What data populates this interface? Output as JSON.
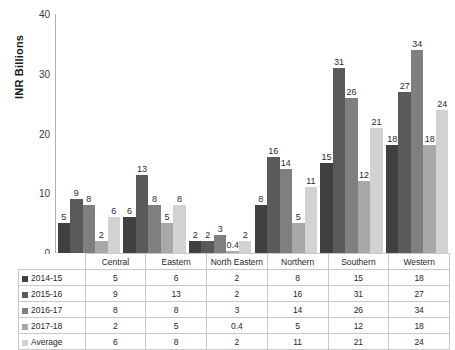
{
  "chart_data": {
    "type": "bar",
    "title": "",
    "subtitle": "",
    "xlabel": "",
    "ylabel": "INR Billions",
    "ylim": [
      0,
      40
    ],
    "yticks": [
      0,
      10,
      20,
      30,
      40
    ],
    "grid": false,
    "legend_position": "data-table",
    "data_labels": true,
    "categories": [
      "Central",
      "Eastern",
      "North Eastern",
      "Northern",
      "Southern",
      "Western"
    ],
    "series": [
      {
        "name": "2014-15",
        "color": "#404040",
        "values": [
          5,
          6,
          2,
          8,
          15,
          18
        ]
      },
      {
        "name": "2015-16",
        "color": "#5a5a5a",
        "values": [
          9,
          13,
          2,
          16,
          31,
          27
        ]
      },
      {
        "name": "2016-17",
        "color": "#7f7f7f",
        "values": [
          8,
          8,
          3,
          14,
          26,
          34
        ]
      },
      {
        "name": "2017-18",
        "color": "#a8a8a8",
        "values": [
          2,
          5,
          0.4,
          5,
          12,
          18
        ]
      },
      {
        "name": "Average",
        "color": "#d2d2d2",
        "values": [
          6,
          8,
          2,
          11,
          21,
          24
        ]
      }
    ],
    "value_labels": [
      [
        "5",
        "6",
        "2",
        "8",
        "15",
        "18"
      ],
      [
        "9",
        "13",
        "2",
        "16",
        "31",
        "27"
      ],
      [
        "8",
        "8",
        "3",
        "14",
        "26",
        "34"
      ],
      [
        "2",
        "5",
        "0.4",
        "5",
        "12",
        "18"
      ],
      [
        "6",
        "8",
        "2",
        "11",
        "21",
        "24"
      ]
    ]
  },
  "table": {
    "corner_label": "",
    "column_headers": [
      "Central",
      "Eastern",
      "North Eastern",
      "Northern",
      "Southern",
      "Western"
    ],
    "rows": [
      {
        "label": "2014-15",
        "color": "#404040",
        "values": [
          "5",
          "6",
          "2",
          "8",
          "15",
          "18"
        ]
      },
      {
        "label": "2015-16",
        "color": "#5a5a5a",
        "values": [
          "9",
          "13",
          "2",
          "16",
          "31",
          "27"
        ]
      },
      {
        "label": "2016-17",
        "color": "#7f7f7f",
        "values": [
          "8",
          "8",
          "3",
          "14",
          "26",
          "34"
        ]
      },
      {
        "label": "2017-18",
        "color": "#a8a8a8",
        "values": [
          "2",
          "5",
          "0.4",
          "5",
          "12",
          "18"
        ]
      },
      {
        "label": "Average",
        "color": "#d2d2d2",
        "values": [
          "6",
          "8",
          "2",
          "11",
          "21",
          "24"
        ]
      }
    ]
  }
}
